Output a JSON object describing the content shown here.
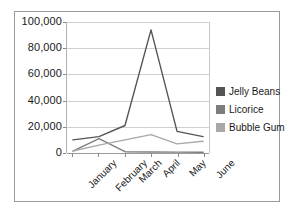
{
  "chart_data": {
    "type": "line",
    "title": "",
    "xlabel": "",
    "ylabel": "",
    "categories": [
      "January",
      "February",
      "March",
      "April",
      "May",
      "June"
    ],
    "series": [
      {
        "name": "Jelly Beans",
        "color": "#545454",
        "values": [
          10000,
          12500,
          21000,
          94000,
          16500,
          12500
        ]
      },
      {
        "name": "Licorice",
        "color": "#7d7d7d",
        "values": [
          1500,
          11000,
          1000,
          800,
          700,
          600
        ]
      },
      {
        "name": "Bubble Gum",
        "color": "#a8a8a8",
        "values": [
          1500,
          6000,
          10000,
          14000,
          7000,
          9000
        ]
      }
    ],
    "ylim": [
      0,
      100000
    ],
    "yticks": [
      0,
      20000,
      40000,
      60000,
      80000,
      100000
    ],
    "ytick_labels": [
      "0",
      "20,000",
      "40,000",
      "60,000",
      "80,000",
      "100,000"
    ],
    "grid": true,
    "legend_position": "right"
  },
  "legend": {
    "entries": [
      {
        "label": "Jelly Beans",
        "color": "#545454"
      },
      {
        "label": "Licorice",
        "color": "#7d7d7d"
      },
      {
        "label": "Bubble Gum",
        "color": "#a8a8a8"
      }
    ]
  },
  "axes": {
    "y_labels": [
      "100,000",
      "80,000",
      "60,000",
      "40,000",
      "20,000",
      "0"
    ],
    "x_labels": [
      "January",
      "February",
      "March",
      "April",
      "May",
      "June"
    ]
  }
}
